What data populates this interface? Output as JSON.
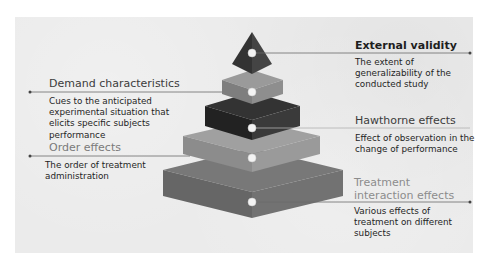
{
  "diagram": {
    "type": "layered-pyramid",
    "colors": {
      "panel_background": "#ebebeb",
      "tip": "#3a3a3a",
      "layer_2": "#8a8a8a",
      "layer_3": "#2a2a2a",
      "layer_4": "#959595",
      "layer_5": "#6e6e6e",
      "connector_line": "#6a6a6a",
      "marker_dot": "#f2f2f2"
    },
    "items": [
      {
        "id": "external-validity",
        "side": "right",
        "title": "External validity",
        "description": "The extent of generalizability of the conducted study"
      },
      {
        "id": "demand-characteristics",
        "side": "left",
        "title": "Demand characteristics",
        "description": "Cues to the anticipated experimental situation that elicits specific subjects performance"
      },
      {
        "id": "hawthorne-effects",
        "side": "right",
        "title": "Hawthorne effects",
        "description": "Effect of observation in the change of performance"
      },
      {
        "id": "order-effects",
        "side": "left",
        "title": "Order effects",
        "description": "The order of treatment administration"
      },
      {
        "id": "treatment-interaction-effects",
        "side": "right",
        "title": "Treatment interaction effects",
        "description": "Various effects of treatment on different subjects"
      }
    ]
  }
}
